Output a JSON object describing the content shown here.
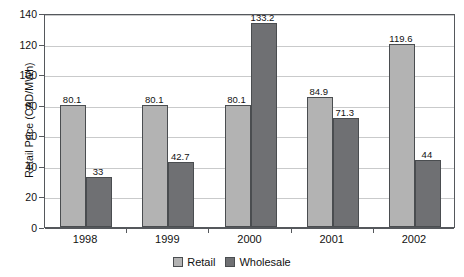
{
  "chart_data": {
    "type": "bar",
    "title": "",
    "xlabel": "",
    "ylabel": "Retail Price (CAD/MWh)",
    "categories": [
      "1998",
      "1999",
      "2000",
      "2001",
      "2002"
    ],
    "series": [
      {
        "name": "Retail",
        "values": [
          80.1,
          80.1,
          80.1,
          84.9,
          119.6
        ],
        "labels": [
          "80.1",
          "80.1",
          "80.1",
          "84.9",
          "119.6"
        ],
        "color": "#b3b3b3"
      },
      {
        "name": "Wholesale",
        "values": [
          33,
          42.7,
          133.2,
          71.3,
          44
        ],
        "labels": [
          "33",
          "42.7",
          "133.2",
          "71.3",
          "44"
        ],
        "color": "#6f7073"
      }
    ],
    "ylim": [
      0,
      140
    ],
    "yticks": [
      0,
      20,
      40,
      60,
      80,
      100,
      120,
      140
    ],
    "ytick_labels": [
      "0",
      "20",
      "40",
      "60",
      "80",
      "100",
      "120",
      "140"
    ],
    "grid": "horizontal",
    "legend_position": "bottom-center"
  },
  "legend": {
    "items": [
      {
        "label": "Retail"
      },
      {
        "label": "Wholesale"
      }
    ]
  },
  "axes": {
    "y_title": "Retail Price (CAD/MWh)"
  }
}
